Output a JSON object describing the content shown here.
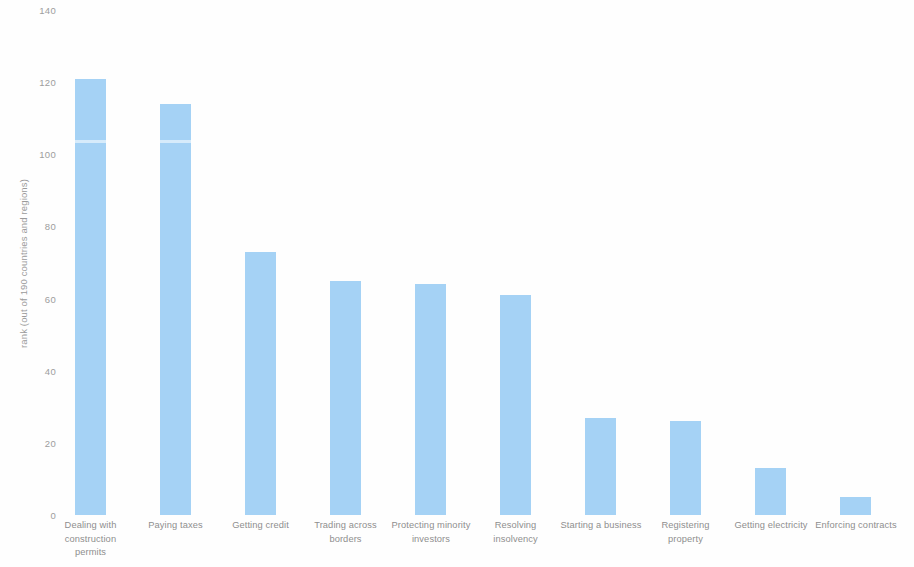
{
  "chart_data": {
    "type": "bar",
    "title": "",
    "xlabel": "",
    "ylabel": "rank (out of 190 countries and regions)",
    "ylim": [
      0,
      140
    ],
    "yticks": [
      0,
      20,
      40,
      60,
      80,
      100,
      120,
      140
    ],
    "grid": false,
    "legend": null,
    "bar_color": "#a5d2f5",
    "background_color": "#ffffff",
    "categories": [
      "Dealing with construction permits",
      "Paying taxes",
      "Getting credit",
      "Trading across borders",
      "Protecting minority investors",
      "Resolving insolvency",
      "Starting a business",
      "Registering property",
      "Getting electricity",
      "Enforcing contracts"
    ],
    "category_lines": [
      [
        "Dealing with",
        "construction",
        "permits"
      ],
      [
        "Paying taxes"
      ],
      [
        "Getting credit"
      ],
      [
        "Trading across",
        "borders"
      ],
      [
        "Protecting minority",
        "investors"
      ],
      [
        "Resolving",
        "insolvency"
      ],
      [
        "Starting a business"
      ],
      [
        "Registering",
        "property"
      ],
      [
        "Getting electricity"
      ],
      [
        "Enforcing contracts"
      ]
    ],
    "values": [
      121,
      114,
      73,
      65,
      64,
      61,
      27,
      26,
      13,
      5
    ]
  }
}
